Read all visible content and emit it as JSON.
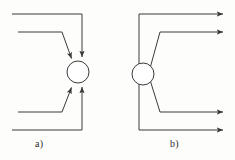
{
  "figure": {
    "background_color": "#fdfdfb",
    "stroke_color": "#3a3a3a",
    "stroke_width": 1,
    "node_fill": "#ffffff",
    "width": 235,
    "height": 160
  },
  "panels": [
    {
      "id": "a",
      "caption": "a)",
      "caption_x": 35,
      "caption_y": 138,
      "kind": "fan-in",
      "node": {
        "cx": 78,
        "cy": 72,
        "r": 11
      },
      "arrow_count": 4,
      "arrow_direction": "into-node",
      "edges": [
        {
          "name": "edge-top-outer",
          "points": "12,14 82,14 82,56",
          "arrow_at": "82,56",
          "arrow_angle": 90
        },
        {
          "name": "edge-top-inner",
          "points": "18,32 62,32 72,60",
          "arrow_at": "72,60",
          "arrow_angle": 70
        },
        {
          "name": "edge-bottom-inner",
          "points": "18,112 62,112 72,86",
          "arrow_at": "72,86",
          "arrow_angle": -70
        },
        {
          "name": "edge-bottom-outer",
          "points": "12,130 82,130 82,88",
          "arrow_at": "82,88",
          "arrow_angle": -90
        }
      ]
    },
    {
      "id": "b",
      "caption": "b)",
      "caption_x": 170,
      "caption_y": 138,
      "kind": "fan-out",
      "node": {
        "cx": 143,
        "cy": 74,
        "r": 11
      },
      "arrow_count": 4,
      "arrow_direction": "out-of-node",
      "edges": [
        {
          "name": "edge-top-outer",
          "points": "139,63 139,14 224,14",
          "arrow_at": "224,14",
          "arrow_angle": 0
        },
        {
          "name": "edge-top-inner",
          "points": "150,66 160,32 224,32",
          "arrow_at": "224,32",
          "arrow_angle": 0
        },
        {
          "name": "edge-bottom-inner",
          "points": "150,82 160,112 224,112",
          "arrow_at": "224,112",
          "arrow_angle": 0
        },
        {
          "name": "edge-bottom-outer",
          "points": "139,85 139,130 224,130",
          "arrow_at": "224,130",
          "arrow_angle": 0
        }
      ]
    }
  ]
}
